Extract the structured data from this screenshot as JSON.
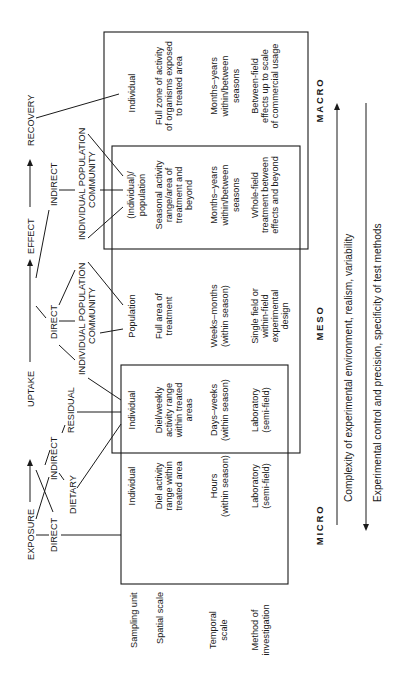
{
  "flow": {
    "exposure": "EXPOSURE",
    "uptake": "UPTAKE",
    "effect": "EFFECT",
    "recovery": "RECOVERY",
    "exposure_direct": "DIRECT",
    "exposure_indirect": "INDIRECT",
    "exposure_dietary": "DIETARY",
    "uptake_residual": "RESIDUAL",
    "effect_direct": "DIRECT",
    "effect_direct_levels_1": "INDIVIDUAL POPULATION",
    "effect_direct_levels_2": "COMMUNITY",
    "effect_indirect": "INDIRECT",
    "effect_indirect_levels_1": "INDIVIDUAL POPULATION",
    "effect_indirect_levels_2": "COMMUNITY"
  },
  "row_labels": {
    "sampling_unit": "Sampling unit",
    "spatial_scale": "Spatial scale",
    "temporal_scale_1": "Temporal",
    "temporal_scale_2": "scale",
    "method_1": "Method of",
    "method_2": "investigation"
  },
  "columns": [
    {
      "scale": "MICRO",
      "sampling_unit": "Individual",
      "spatial": [
        "Diel activity",
        "range within",
        "treated area"
      ],
      "temporal": [
        "Hours",
        "(within season)"
      ],
      "method": [
        "Laboratory",
        "(semi-field)"
      ]
    },
    {
      "sampling_unit": "Individual",
      "spatial": [
        "Diel/weekly",
        "activity range",
        "within treated",
        "areas"
      ],
      "temporal": [
        "Days–weeks",
        "(within season)"
      ],
      "method": [
        "Laboratory",
        "(semi-field)"
      ]
    },
    {
      "scale": "MESO",
      "sampling_unit": "Population",
      "spatial": [
        "Full area of",
        "treatment"
      ],
      "temporal": [
        "Weeks–months",
        "(within season)"
      ],
      "method": [
        "Single field or",
        "within-field",
        "experimental",
        "design"
      ]
    },
    {
      "sampling_unit": [
        "(Individual)/",
        "population"
      ],
      "spatial": [
        "Seasonal activity",
        "range/area of",
        "treatment and",
        "beyond"
      ],
      "temporal": [
        "Months–years",
        "within/between",
        "seasons"
      ],
      "method": [
        "Whole-field",
        "treatment between",
        "effects and beyond"
      ]
    },
    {
      "scale": "MACRO",
      "sampling_unit": "Individual",
      "spatial": [
        "Full zone of activity",
        "of organisms exposed",
        "to treated area"
      ],
      "temporal": [
        "Months–years",
        "within/between",
        "seasons"
      ],
      "method": [
        "Between-field",
        "effects up to scale",
        "of commercial usage"
      ]
    }
  ],
  "axes": {
    "complexity": "Complexity of experimental environment, realism, variability",
    "control": "Experimental control and precision, specificity of test methods"
  },
  "colors": {
    "ink": "#1a1a1a",
    "background": "#ffffff"
  }
}
